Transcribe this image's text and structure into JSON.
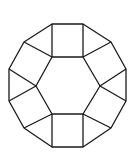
{
  "diagram": {
    "title": "",
    "stroke_color": "#1a1a1a",
    "background": "#ffffff",
    "outer_dodecagon": [
      [
        52,
        24
      ],
      [
        83,
        24
      ],
      [
        111,
        42
      ],
      [
        126,
        69
      ],
      [
        126,
        101
      ],
      [
        111,
        128
      ],
      [
        83,
        147
      ],
      [
        52,
        147
      ],
      [
        24,
        128
      ],
      [
        9,
        101
      ],
      [
        9,
        69
      ],
      [
        24,
        42
      ]
    ],
    "inner_hexagon": [
      [
        52,
        57
      ],
      [
        83,
        57
      ],
      [
        100,
        86
      ],
      [
        83,
        114
      ],
      [
        52,
        114
      ],
      [
        36,
        86
      ]
    ],
    "spokes": [
      [
        [
          52,
          57
        ],
        [
          52,
          24
        ]
      ],
      [
        [
          83,
          57
        ],
        [
          83,
          24
        ]
      ],
      [
        [
          83,
          57
        ],
        [
          111,
          42
        ]
      ],
      [
        [
          100,
          86
        ],
        [
          126,
          69
        ]
      ],
      [
        [
          100,
          86
        ],
        [
          126,
          101
        ]
      ],
      [
        [
          83,
          114
        ],
        [
          111,
          128
        ]
      ],
      [
        [
          83,
          114
        ],
        [
          83,
          147
        ]
      ],
      [
        [
          52,
          114
        ],
        [
          52,
          147
        ]
      ],
      [
        [
          52,
          114
        ],
        [
          24,
          128
        ]
      ],
      [
        [
          36,
          86
        ],
        [
          9,
          101
        ]
      ],
      [
        [
          36,
          86
        ],
        [
          9,
          69
        ]
      ],
      [
        [
          52,
          57
        ],
        [
          24,
          42
        ]
      ]
    ]
  }
}
